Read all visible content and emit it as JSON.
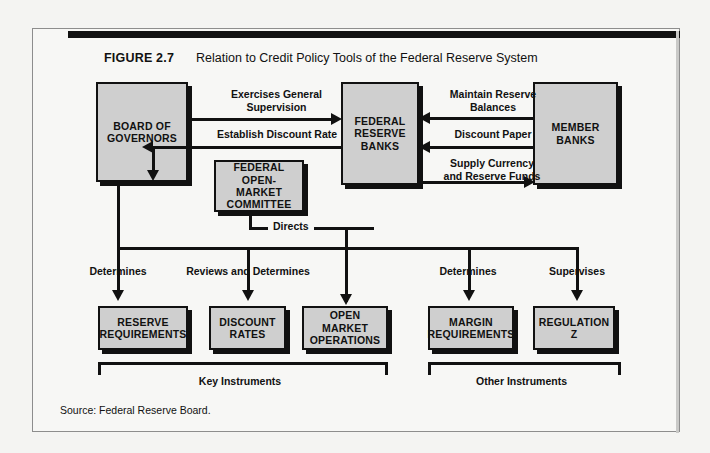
{
  "figure": {
    "number": "FIGURE 2.7",
    "title": "Relation to Credit Policy Tools of the Federal Reserve System",
    "source": "Source: Federal Reserve Board."
  },
  "nodes": {
    "board": "BOARD OF\nGOVERNORS",
    "board_l1": "BOARD OF",
    "board_l2": "GOVERNORS",
    "frb_l1": "FEDERAL",
    "frb_l2": "RESERVE",
    "frb_l3": "BANKS",
    "member_l1": "MEMBER",
    "member_l2": "BANKS",
    "fomc_l1": "FEDERAL",
    "fomc_l2": "OPEN-MARKET",
    "fomc_l3": "COMMITTEE",
    "reserve_l1": "RESERVE",
    "reserve_l2": "REQUIREMENTS",
    "discount_l1": "DISCOUNT",
    "discount_l2": "RATES",
    "openmarket_l1": "OPEN MARKET",
    "openmarket_l2": "OPERATIONS",
    "margin_l1": "MARGIN",
    "margin_l2": "REQUIREMENTS",
    "regz_l1": "REGULATION",
    "regz_l2": "Z"
  },
  "edges": {
    "exercises_l1": "Exercises General",
    "exercises_l2": "Supervision",
    "establish": "Establish Discount Rate",
    "maintain_l1": "Maintain Reserve",
    "maintain_l2": "Balances",
    "discount_paper": "Discount Paper",
    "supply_l1": "Supply Currency",
    "supply_l2": "and Reserve Funds",
    "directs": "Directs",
    "determines_reserve": "Determines",
    "reviews_determines": "Reviews and Determines",
    "determines_margin": "Determines",
    "supervises": "Supervises"
  },
  "brackets": {
    "key": "Key Instruments",
    "other": "Other Instruments"
  },
  "colors": {
    "box_fill": "#cfcfcf",
    "line": "#111111",
    "page": "#f7f7f5"
  }
}
